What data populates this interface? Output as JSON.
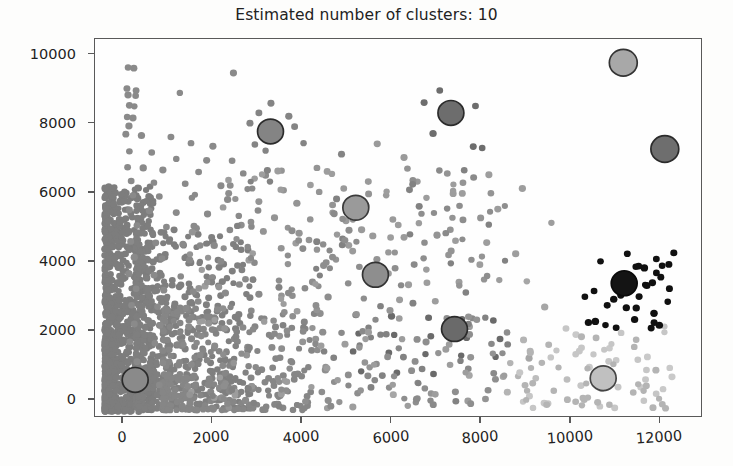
{
  "chart_data": {
    "type": "scatter",
    "title": "Estimated number of clusters: 10",
    "xlabel": "",
    "ylabel": "",
    "xlim": [
      -620,
      12950
    ],
    "ylim": [
      -520,
      10450
    ],
    "xticks": [
      0,
      2000,
      4000,
      6000,
      8000,
      10000,
      12000
    ],
    "yticks": [
      0,
      2000,
      4000,
      6000,
      8000,
      10000
    ],
    "xtick_labels": [
      "0",
      "2000",
      "4000",
      "6000",
      "8000",
      "10000",
      "12000"
    ],
    "ytick_labels": [
      "0",
      "2000",
      "4000",
      "6000",
      "8000",
      "10000"
    ],
    "grid": false,
    "legend": false,
    "n_clusters": 10,
    "marker_size_points": 5,
    "center_marker_size_points": 15,
    "cluster_colors": [
      "#8a8a8a",
      "#7e7e7e",
      "#949494",
      "#888888",
      "#6f6f6f",
      "#a6a6a6",
      "#9d9d9d",
      "#bdbdbd",
      "#c9c9c9",
      "#111111"
    ],
    "centers": [
      {
        "label": "center-1",
        "x": 280,
        "y": 530,
        "color": "#8a8a8a",
        "edge": "#2b2b2b",
        "r": 13
      },
      {
        "label": "center-2",
        "x": 3310,
        "y": 7760,
        "color": "#848484",
        "edge": "#2b2b2b",
        "r": 13
      },
      {
        "label": "center-3",
        "x": 5220,
        "y": 5540,
        "color": "#9a9a9a",
        "edge": "#3a3a3a",
        "r": 13
      },
      {
        "label": "center-4",
        "x": 5660,
        "y": 3590,
        "color": "#8e8e8e",
        "edge": "#333333",
        "r": 13
      },
      {
        "label": "center-5",
        "x": 7350,
        "y": 8300,
        "color": "#6d6d6d",
        "edge": "#2b2b2b",
        "r": 13
      },
      {
        "label": "center-6",
        "x": 7430,
        "y": 2010,
        "color": "#6a6a6a",
        "edge": "#2b2b2b",
        "r": 13
      },
      {
        "label": "center-7",
        "x": 10760,
        "y": 580,
        "color": "#c0c0c0",
        "edge": "#444444",
        "r": 13
      },
      {
        "label": "center-8",
        "x": 11210,
        "y": 9760,
        "color": "#a8a8a8",
        "edge": "#333333",
        "r": 14
      },
      {
        "label": "center-9",
        "x": 11230,
        "y": 3340,
        "color": "#141414",
        "edge": "#0a0a0a",
        "r": 13
      },
      {
        "label": "center-10",
        "x": 12140,
        "y": 7250,
        "color": "#6e6e6e",
        "edge": "#2b2b2b",
        "r": 14
      }
    ],
    "dense_band": {
      "description": "very dense dark-gray cluster hugging the left edge",
      "x_range": [
        -400,
        700
      ],
      "y_range": [
        -400,
        6200
      ],
      "color": "#7d7d7d",
      "count": 900
    },
    "points": [
      [
        120,
        9620,
        "#8a8a8a"
      ],
      [
        250,
        9600,
        "#8a8a8a"
      ],
      [
        95,
        9010,
        "#8a8a8a"
      ],
      [
        300,
        8950,
        "#8a8a8a"
      ],
      [
        120,
        8820,
        "#8a8a8a"
      ],
      [
        290,
        8800,
        "#8a8a8a"
      ],
      [
        150,
        8520,
        "#8a8a8a"
      ],
      [
        260,
        8490,
        "#8a8a8a"
      ],
      [
        1280,
        8880,
        "#8a8a8a"
      ],
      [
        100,
        8180,
        "#8a8a8a"
      ],
      [
        230,
        8150,
        "#8a8a8a"
      ],
      [
        140,
        7920,
        "#8a8a8a"
      ],
      [
        70,
        7680,
        "#8a8a8a"
      ],
      [
        420,
        7640,
        "#8a8a8a"
      ],
      [
        1080,
        7600,
        "#8a8a8a"
      ],
      [
        1530,
        7420,
        "#8a8a8a"
      ],
      [
        2020,
        7330,
        "#8a8a8a"
      ],
      [
        150,
        7180,
        "#8a8a8a"
      ],
      [
        650,
        7150,
        "#8a8a8a"
      ],
      [
        1200,
        6960,
        "#8a8a8a"
      ],
      [
        1880,
        6920,
        "#8a8a8a"
      ],
      [
        2450,
        6910,
        "#8a8a8a"
      ],
      [
        110,
        6720,
        "#8a8a8a"
      ],
      [
        460,
        6700,
        "#8a8a8a"
      ],
      [
        900,
        6640,
        "#8a8a8a"
      ],
      [
        1700,
        6580,
        "#8a8a8a"
      ],
      [
        2700,
        6540,
        "#8a8a8a"
      ],
      [
        3200,
        6480,
        "#8a8a8a"
      ],
      [
        190,
        6320,
        "#8a8a8a"
      ],
      [
        700,
        6270,
        "#8a8a8a"
      ],
      [
        1400,
        6240,
        "#8a8a8a"
      ],
      [
        2200,
        6180,
        "#8a8a8a"
      ],
      [
        2900,
        6100,
        "#8a8a8a"
      ],
      [
        3600,
        6050,
        "#949494"
      ],
      [
        4400,
        6000,
        "#949494"
      ],
      [
        230,
        5900,
        "#8a8a8a"
      ],
      [
        820,
        5870,
        "#8a8a8a"
      ],
      [
        1550,
        5830,
        "#8a8a8a"
      ],
      [
        2350,
        5780,
        "#8a8a8a"
      ],
      [
        3050,
        5720,
        "#949494"
      ],
      [
        3900,
        5670,
        "#949494"
      ],
      [
        4700,
        5620,
        "#949494"
      ],
      [
        5450,
        5600,
        "#9a9a9a"
      ],
      [
        150,
        5480,
        "#8a8a8a"
      ],
      [
        600,
        5450,
        "#8a8a8a"
      ],
      [
        1200,
        5400,
        "#8a8a8a"
      ],
      [
        1900,
        5360,
        "#8a8a8a"
      ],
      [
        2600,
        5300,
        "#8a8a8a"
      ],
      [
        3400,
        5250,
        "#949494"
      ],
      [
        4200,
        5200,
        "#949494"
      ],
      [
        5000,
        5160,
        "#9a9a9a"
      ],
      [
        320,
        5020,
        "#8a8a8a"
      ],
      [
        980,
        4980,
        "#8a8a8a"
      ],
      [
        1650,
        4940,
        "#8a8a8a"
      ],
      [
        2400,
        4890,
        "#8a8a8a"
      ],
      [
        3150,
        4850,
        "#949494"
      ],
      [
        3950,
        4800,
        "#949494"
      ],
      [
        4800,
        4760,
        "#9a9a9a"
      ],
      [
        5600,
        4720,
        "#9a9a9a"
      ],
      [
        6300,
        4680,
        "#9a9a9a"
      ],
      [
        180,
        4560,
        "#8a8a8a"
      ],
      [
        740,
        4520,
        "#8a8a8a"
      ],
      [
        1350,
        4480,
        "#8a8a8a"
      ],
      [
        2050,
        4440,
        "#8a8a8a"
      ],
      [
        2800,
        4400,
        "#8a8a8a"
      ],
      [
        3550,
        4360,
        "#949494"
      ],
      [
        4350,
        4320,
        "#949494"
      ],
      [
        5150,
        4280,
        "#9a9a9a"
      ],
      [
        5950,
        4240,
        "#9a9a9a"
      ],
      [
        260,
        4100,
        "#8a8a8a"
      ],
      [
        880,
        4060,
        "#8a8a8a"
      ],
      [
        1500,
        4020,
        "#8a8a8a"
      ],
      [
        2200,
        3980,
        "#8a8a8a"
      ],
      [
        2950,
        3940,
        "#8a8a8a"
      ],
      [
        3700,
        3900,
        "#949494"
      ],
      [
        4500,
        3860,
        "#8e8e8e"
      ],
      [
        5300,
        3820,
        "#8e8e8e"
      ],
      [
        6100,
        3780,
        "#8e8e8e"
      ],
      [
        6800,
        3740,
        "#9d9d9d"
      ],
      [
        140,
        3620,
        "#8a8a8a"
      ],
      [
        700,
        3580,
        "#8a8a8a"
      ],
      [
        1300,
        3540,
        "#8a8a8a"
      ],
      [
        2000,
        3500,
        "#8a8a8a"
      ],
      [
        2750,
        3460,
        "#8a8a8a"
      ],
      [
        3500,
        3420,
        "#8e8e8e"
      ],
      [
        4250,
        3380,
        "#8e8e8e"
      ],
      [
        5050,
        3340,
        "#8e8e8e"
      ],
      [
        6400,
        3300,
        "#9d9d9d"
      ],
      [
        300,
        3180,
        "#8a8a8a"
      ],
      [
        920,
        3140,
        "#8a8a8a"
      ],
      [
        1580,
        3100,
        "#8a8a8a"
      ],
      [
        2300,
        3060,
        "#8a8a8a"
      ],
      [
        3050,
        3020,
        "#8a8a8a"
      ],
      [
        3800,
        2980,
        "#8e8e8e"
      ],
      [
        4600,
        2940,
        "#8e8e8e"
      ],
      [
        5400,
        2900,
        "#8e8e8e"
      ],
      [
        6200,
        2860,
        "#9d9d9d"
      ],
      [
        7000,
        2820,
        "#9d9d9d"
      ],
      [
        200,
        2700,
        "#8a8a8a"
      ],
      [
        780,
        2660,
        "#8a8a8a"
      ],
      [
        1420,
        2620,
        "#8a8a8a"
      ],
      [
        2120,
        2580,
        "#8a8a8a"
      ],
      [
        2880,
        2540,
        "#8a8a8a"
      ],
      [
        3620,
        2500,
        "#8e8e8e"
      ],
      [
        4420,
        2460,
        "#8e8e8e"
      ],
      [
        5220,
        2420,
        "#6a6a6a"
      ],
      [
        6020,
        2380,
        "#6a6a6a"
      ],
      [
        6850,
        2340,
        "#6a6a6a"
      ],
      [
        7600,
        2300,
        "#6a6a6a"
      ],
      [
        8300,
        2260,
        "#6a6a6a"
      ],
      [
        260,
        2160,
        "#8a8a8a"
      ],
      [
        840,
        2120,
        "#8a8a8a"
      ],
      [
        1480,
        2080,
        "#8a8a8a"
      ],
      [
        2180,
        2040,
        "#8a8a8a"
      ],
      [
        2920,
        2000,
        "#8a8a8a"
      ],
      [
        3680,
        1960,
        "#8e8e8e"
      ],
      [
        4480,
        1920,
        "#8e8e8e"
      ],
      [
        5280,
        1880,
        "#6a6a6a"
      ],
      [
        6080,
        1840,
        "#6a6a6a"
      ],
      [
        6900,
        1800,
        "#6a6a6a"
      ],
      [
        7700,
        1760,
        "#6a6a6a"
      ],
      [
        8450,
        1720,
        "#6a6a6a"
      ],
      [
        160,
        1640,
        "#8a8a8a"
      ],
      [
        720,
        1600,
        "#8a8a8a"
      ],
      [
        1360,
        1560,
        "#8a8a8a"
      ],
      [
        2060,
        1520,
        "#8a8a8a"
      ],
      [
        2800,
        1480,
        "#8a8a8a"
      ],
      [
        3560,
        1440,
        "#8e8e8e"
      ],
      [
        4360,
        1400,
        "#8e8e8e"
      ],
      [
        5160,
        1360,
        "#6a6a6a"
      ],
      [
        5960,
        1320,
        "#6a6a6a"
      ],
      [
        6780,
        1280,
        "#6a6a6a"
      ],
      [
        7580,
        1240,
        "#6a6a6a"
      ],
      [
        8350,
        1200,
        "#6a6a6a"
      ],
      [
        9100,
        1160,
        "#a6a6a6"
      ],
      [
        320,
        1060,
        "#8a8a8a"
      ],
      [
        900,
        1020,
        "#8a8a8a"
      ],
      [
        1540,
        980,
        "#8a8a8a"
      ],
      [
        2240,
        940,
        "#8a8a8a"
      ],
      [
        2980,
        900,
        "#8a8a8a"
      ],
      [
        3740,
        860,
        "#8e8e8e"
      ],
      [
        4540,
        820,
        "#8e8e8e"
      ],
      [
        5340,
        780,
        "#6a6a6a"
      ],
      [
        6140,
        740,
        "#6a6a6a"
      ],
      [
        6960,
        700,
        "#6a6a6a"
      ],
      [
        7760,
        660,
        "#a6a6a6"
      ],
      [
        8520,
        620,
        "#a6a6a6"
      ],
      [
        9250,
        580,
        "#bdbdbd"
      ],
      [
        9950,
        540,
        "#bdbdbd"
      ],
      [
        10450,
        900,
        "#c9c9c9"
      ],
      [
        11050,
        1100,
        "#c9c9c9"
      ],
      [
        11600,
        320,
        "#c9c9c9"
      ],
      [
        12100,
        260,
        "#c9c9c9"
      ],
      [
        240,
        420,
        "#8a8a8a"
      ],
      [
        820,
        380,
        "#8a8a8a"
      ],
      [
        1460,
        340,
        "#8a8a8a"
      ],
      [
        2160,
        300,
        "#8a8a8a"
      ],
      [
        2900,
        260,
        "#8a8a8a"
      ],
      [
        3660,
        220,
        "#8e8e8e"
      ],
      [
        4460,
        180,
        "#8e8e8e"
      ],
      [
        5260,
        140,
        "#8e8e8e"
      ],
      [
        6060,
        100,
        "#a6a6a6"
      ],
      [
        3320,
        8580,
        "#848484"
      ],
      [
        3050,
        8300,
        "#848484"
      ],
      [
        3720,
        8200,
        "#848484"
      ],
      [
        2850,
        8000,
        "#848484"
      ],
      [
        3850,
        7900,
        "#848484"
      ],
      [
        2960,
        7380,
        "#848484"
      ],
      [
        3200,
        7200,
        "#848484"
      ],
      [
        4050,
        7420,
        "#848484"
      ],
      [
        7100,
        8950,
        "#6d6d6d"
      ],
      [
        6750,
        8600,
        "#6d6d6d"
      ],
      [
        7900,
        8500,
        "#6d6d6d"
      ],
      [
        6950,
        7700,
        "#6d6d6d"
      ],
      [
        7850,
        7320,
        "#6d6d6d"
      ],
      [
        8050,
        7280,
        "#6d6d6d"
      ],
      [
        5500,
        6300,
        "#9a9a9a"
      ],
      [
        4950,
        6100,
        "#9a9a9a"
      ],
      [
        5900,
        5900,
        "#9a9a9a"
      ],
      [
        4700,
        5400,
        "#9a9a9a"
      ],
      [
        6050,
        5200,
        "#9a9a9a"
      ],
      [
        5350,
        4900,
        "#9a9a9a"
      ],
      [
        11300,
        4200,
        "#111111"
      ],
      [
        11950,
        4050,
        "#111111"
      ],
      [
        12080,
        3850,
        "#111111"
      ],
      [
        10700,
        3980,
        "#111111"
      ],
      [
        12050,
        3520,
        "#111111"
      ],
      [
        11700,
        3300,
        "#111111"
      ],
      [
        10350,
        2950,
        "#111111"
      ],
      [
        10850,
        2700,
        "#111111"
      ],
      [
        11500,
        2620,
        "#111111"
      ],
      [
        11900,
        2200,
        "#111111"
      ],
      [
        11050,
        2050,
        "#111111"
      ],
      [
        10150,
        1850,
        "#c9c9c9"
      ],
      [
        12250,
        880,
        "#c9c9c9"
      ],
      [
        12300,
        620,
        "#c9c9c9"
      ],
      [
        10900,
        1450,
        "#c9c9c9"
      ],
      [
        11750,
        1200,
        "#c9c9c9"
      ],
      [
        9450,
        2650,
        "#a6a6a6"
      ],
      [
        9050,
        3400,
        "#a6a6a6"
      ],
      [
        8800,
        4200,
        "#9d9d9d"
      ],
      [
        9600,
        5100,
        "#9d9d9d"
      ],
      [
        8400,
        5500,
        "#9d9d9d"
      ],
      [
        8950,
        6100,
        "#9d9d9d"
      ],
      [
        8200,
        6500,
        "#9d9d9d"
      ],
      [
        7400,
        5950,
        "#9d9d9d"
      ],
      [
        6600,
        6300,
        "#9a9a9a"
      ],
      [
        6300,
        7000,
        "#9a9a9a"
      ],
      [
        5700,
        7400,
        "#9a9a9a"
      ],
      [
        4900,
        7100,
        "#848484"
      ],
      [
        4350,
        6700,
        "#949494"
      ],
      [
        2480,
        9460,
        "#8a8a8a"
      ]
    ]
  }
}
